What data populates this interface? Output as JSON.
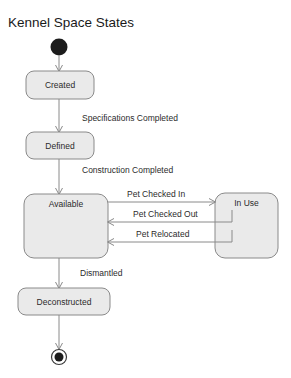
{
  "diagram": {
    "title": "Kennel Space States",
    "type": "uml-state-machine",
    "colors": {
      "state_fill": "#eaeaea",
      "state_border": "#8a8a8a",
      "line": "#8a8a8a",
      "text": "#2b2b2b",
      "title_text": "#1a1a1a",
      "node_fill": "#1c1c1c",
      "background": "#ffffff"
    },
    "nodes": [
      {
        "id": "initial",
        "kind": "initial-state",
        "label": ""
      },
      {
        "id": "created",
        "kind": "state",
        "label": "Created"
      },
      {
        "id": "defined",
        "kind": "state",
        "label": "Defined"
      },
      {
        "id": "available",
        "kind": "state",
        "label": "Available"
      },
      {
        "id": "inuse",
        "kind": "state",
        "label": "In Use"
      },
      {
        "id": "deconstructed",
        "kind": "state",
        "label": "Deconstructed"
      },
      {
        "id": "final",
        "kind": "final-state",
        "label": ""
      }
    ],
    "transitions": [
      {
        "from": "initial",
        "to": "created",
        "label": ""
      },
      {
        "from": "created",
        "to": "defined",
        "label": "Specifications Completed"
      },
      {
        "from": "defined",
        "to": "available",
        "label": "Construction Completed"
      },
      {
        "from": "available",
        "to": "inuse",
        "label": "Pet Checked In"
      },
      {
        "from": "inuse",
        "to": "available",
        "label": "Pet Checked Out"
      },
      {
        "from": "inuse",
        "to": "available",
        "label": "Pet Relocated"
      },
      {
        "from": "available",
        "to": "deconstructed",
        "label": "Dismantled"
      },
      {
        "from": "deconstructed",
        "to": "final",
        "label": ""
      }
    ]
  }
}
